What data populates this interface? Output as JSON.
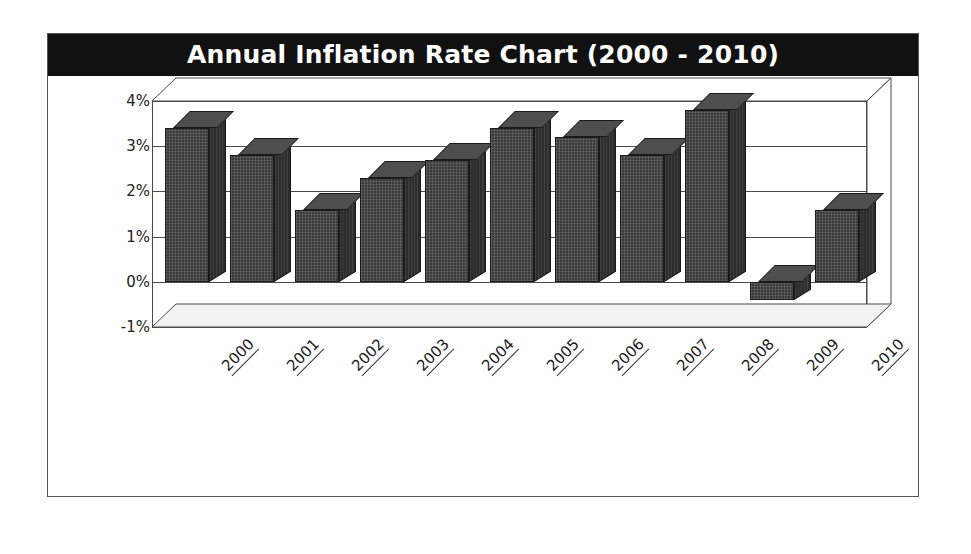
{
  "chart": {
    "title": "Annual Inflation Rate Chart (2000 - 2010)"
  },
  "chart_data": {
    "type": "bar",
    "title": "Annual Inflation Rate Chart (2000 - 2010)",
    "subtitle": "",
    "xlabel": "",
    "ylabel": "",
    "categories": [
      "2000",
      "2001",
      "2002",
      "2003",
      "2004",
      "2005",
      "2006",
      "2007",
      "2008",
      "2009",
      "2010"
    ],
    "values": [
      3.4,
      2.8,
      1.6,
      2.3,
      2.7,
      3.4,
      3.2,
      2.8,
      3.8,
      -0.4,
      1.6
    ],
    "value_unit": "%",
    "ylim": [
      -1,
      4
    ],
    "ytick_labels": [
      "4%",
      "3%",
      "2%",
      "1%",
      "0%",
      "-1%"
    ],
    "ytick_values": [
      4,
      3,
      2,
      1,
      0,
      -1
    ],
    "grid": true,
    "legend": false,
    "legend_position": "none",
    "series": [
      {
        "name": "Annual Inflation Rate",
        "values": [
          3.4,
          2.8,
          1.6,
          2.3,
          2.7,
          3.4,
          3.2,
          2.8,
          3.8,
          -0.4,
          1.6
        ]
      }
    ],
    "style": {
      "three_d": true,
      "bar_face_color": "#3b3b3b",
      "bar_top_color": "#4e4e4e",
      "bar_side_color": "#2c2c2c",
      "gridline_color": "#4a4a4a",
      "title_background": "#111111",
      "title_color": "#ffffff",
      "plot_background": "#ffffff",
      "frame_color": "#555555"
    }
  }
}
